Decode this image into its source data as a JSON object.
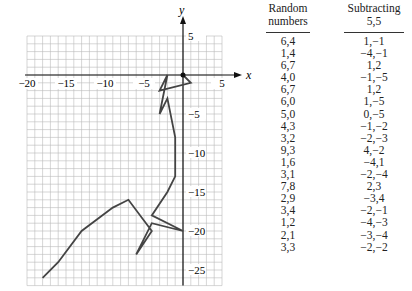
{
  "graph": {
    "x_axis_label": "x",
    "y_axis_label": "y",
    "x_ticks": [
      {
        "value": -20,
        "label": "−20"
      },
      {
        "value": -15,
        "label": "−15"
      },
      {
        "value": -10,
        "label": "−10"
      },
      {
        "value": -5,
        "label": "−5"
      },
      {
        "value": 5,
        "label": "5"
      }
    ],
    "y_ticks": [
      {
        "value": 5,
        "label": "5"
      },
      {
        "value": -5,
        "label": "−5"
      },
      {
        "value": -10,
        "label": "−10"
      },
      {
        "value": -15,
        "label": "−15"
      },
      {
        "value": -20,
        "label": "−20"
      },
      {
        "value": -25,
        "label": "−25"
      }
    ],
    "grid": {
      "xmin": -20,
      "xmax": 5,
      "ymin": -27,
      "ymax": 5
    },
    "line_color": "#444444",
    "grid_color": "#bbbbbb"
  },
  "table": {
    "columns": [
      {
        "header_line1": "Random",
        "header_line2": "numbers"
      },
      {
        "header_line1": "Subtracting",
        "header_line2": "5,5"
      }
    ],
    "rows": [
      [
        "6,4",
        "1,−1"
      ],
      [
        "1,4",
        "−4,−1"
      ],
      [
        "6,7",
        "1,2"
      ],
      [
        "4,0",
        "−1,−5"
      ],
      [
        "6,7",
        "1,2"
      ],
      [
        "6,0",
        "1,−5"
      ],
      [
        "5,0",
        "0,−5"
      ],
      [
        "4,3",
        "−1,−2"
      ],
      [
        "3,2",
        "−2,−3"
      ],
      [
        "9,3",
        "4,−2"
      ],
      [
        "1,6",
        "−4,1"
      ],
      [
        "3,1",
        "−2,−4"
      ],
      [
        "7,8",
        "2,3"
      ],
      [
        "2,9",
        "−3,4"
      ],
      [
        "3,4",
        "−2,−1"
      ],
      [
        "1,2",
        "−4,−3"
      ],
      [
        "2,1",
        "−3,−4"
      ],
      [
        "3,3",
        "−2,−2"
      ]
    ]
  },
  "chart_data": {
    "type": "line",
    "xlabel": "x",
    "ylabel": "y",
    "xlim": [
      -20,
      5
    ],
    "ylim": [
      -27,
      5
    ],
    "grid": true,
    "steps": [
      [
        1,
        -1
      ],
      [
        -4,
        -1
      ],
      [
        1,
        2
      ],
      [
        -1,
        -5
      ],
      [
        1,
        2
      ],
      [
        1,
        -5
      ],
      [
        0,
        -5
      ],
      [
        -1,
        -2
      ],
      [
        -2,
        -3
      ],
      [
        4,
        -2
      ],
      [
        -4,
        1
      ],
      [
        -2,
        -4
      ],
      [
        2,
        3
      ],
      [
        -3,
        4
      ],
      [
        -2,
        -1
      ],
      [
        -4,
        -3
      ],
      [
        -3,
        -4
      ],
      [
        -2,
        -2
      ]
    ],
    "points": [
      [
        0,
        0
      ],
      [
        1,
        -1
      ],
      [
        -3,
        -2
      ],
      [
        -2,
        0
      ],
      [
        -3,
        -5
      ],
      [
        -2,
        -3
      ],
      [
        -1,
        -8
      ],
      [
        -1,
        -13
      ],
      [
        -2,
        -15
      ],
      [
        -4,
        -18
      ],
      [
        0,
        -20
      ],
      [
        -4,
        -19
      ],
      [
        -6,
        -23
      ],
      [
        -4,
        -20
      ],
      [
        -7,
        -16
      ],
      [
        -9,
        -17
      ],
      [
        -13,
        -20
      ],
      [
        -16,
        -24
      ],
      [
        -18,
        -26
      ]
    ]
  }
}
